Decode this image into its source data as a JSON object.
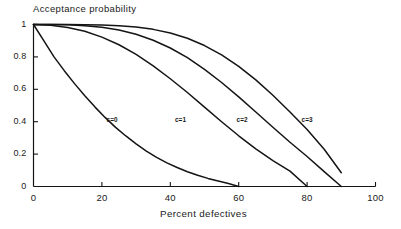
{
  "chart_data": {
    "type": "line",
    "title": "Acceptance probability",
    "xlabel": "Percent defectives",
    "ylabel": "Acceptance probability",
    "xlim": [
      0,
      100
    ],
    "ylim": [
      0,
      1
    ],
    "grid": false,
    "legend_position": "inline-annotations",
    "xticks": [
      "0",
      "20",
      "40",
      "60",
      "80",
      "100"
    ],
    "xtick_values": [
      0,
      20,
      40,
      60,
      80,
      100
    ],
    "yticks": [
      "0",
      "0.2",
      "0.4",
      "0.6",
      "0.8",
      "1"
    ],
    "ytick_values": [
      0,
      0.2,
      0.4,
      0.6,
      0.8,
      1
    ],
    "series": [
      {
        "name": "c=0",
        "label": "c=0",
        "label_x": 24,
        "label_y": 0.41,
        "x": [
          0,
          3,
          6,
          9,
          12,
          15,
          18,
          21,
          24,
          27,
          30,
          33,
          36,
          39,
          42,
          45,
          48,
          51,
          54,
          57,
          60
        ],
        "values": [
          1.0,
          0.9,
          0.8,
          0.715,
          0.635,
          0.56,
          0.49,
          0.425,
          0.365,
          0.312,
          0.263,
          0.219,
          0.18,
          0.146,
          0.117,
          0.091,
          0.069,
          0.05,
          0.034,
          0.018,
          0.0
        ]
      },
      {
        "name": "c=1",
        "label": "c=1",
        "label_x": 44,
        "label_y": 0.41,
        "x": [
          0,
          5,
          10,
          15,
          20,
          25,
          30,
          35,
          40,
          45,
          50,
          55,
          60,
          65,
          70,
          75,
          80
        ],
        "values": [
          1.0,
          0.995,
          0.982,
          0.958,
          0.922,
          0.875,
          0.815,
          0.745,
          0.665,
          0.58,
          0.49,
          0.4,
          0.313,
          0.232,
          0.16,
          0.095,
          0.0
        ]
      },
      {
        "name": "c=2",
        "label": "c=2",
        "label_x": 62,
        "label_y": 0.41,
        "x": [
          0,
          5,
          10,
          15,
          20,
          25,
          30,
          35,
          40,
          45,
          50,
          55,
          60,
          65,
          70,
          75,
          80,
          85,
          90
        ],
        "values": [
          1.0,
          1.0,
          0.998,
          0.993,
          0.983,
          0.966,
          0.94,
          0.903,
          0.855,
          0.795,
          0.723,
          0.642,
          0.553,
          0.46,
          0.366,
          0.273,
          0.185,
          0.092,
          0.0
        ]
      },
      {
        "name": "c=3",
        "label": "c=3",
        "label_x": 81,
        "label_y": 0.41,
        "x": [
          0,
          5,
          10,
          15,
          20,
          25,
          30,
          35,
          40,
          45,
          50,
          55,
          60,
          65,
          70,
          75,
          80,
          85,
          90
        ],
        "values": [
          1.0,
          1.0,
          1.0,
          0.999,
          0.997,
          0.993,
          0.985,
          0.97,
          0.948,
          0.915,
          0.87,
          0.813,
          0.742,
          0.658,
          0.563,
          0.46,
          0.352,
          0.23,
          0.085
        ]
      }
    ],
    "colors": {
      "axis": "#141414",
      "curve": "#141414",
      "background": "#ffffff"
    }
  }
}
